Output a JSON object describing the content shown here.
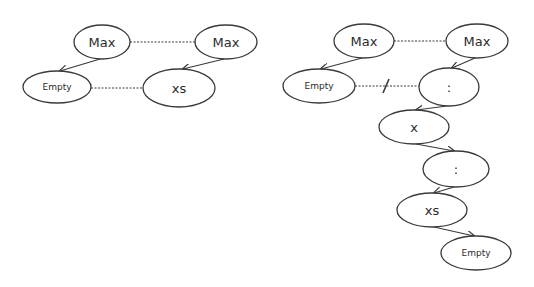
{
  "colors": {
    "stroke": "#3a3a3a",
    "text": "#2b2b2b",
    "background": "#ffffff"
  },
  "diagrams": [
    {
      "id": "before",
      "nodes": [
        {
          "id": "max_a",
          "label": "Max",
          "cx": 102,
          "cy": 42,
          "rx": 28,
          "ry": 17,
          "font": 13
        },
        {
          "id": "max_b",
          "label": "Max",
          "cx": 226,
          "cy": 42,
          "rx": 31,
          "ry": 17,
          "font": 13
        },
        {
          "id": "empty",
          "label": "Empty",
          "cx": 57,
          "cy": 87,
          "rx": 34,
          "ry": 16,
          "font": 9
        },
        {
          "id": "xs",
          "label": "xs",
          "cx": 179,
          "cy": 88,
          "rx": 36,
          "ry": 19,
          "font": 13
        }
      ],
      "arrows": [
        {
          "from": "max_a",
          "to": "empty",
          "x1": 100,
          "y1": 59,
          "x2": 60,
          "y2": 71
        },
        {
          "from": "max_b",
          "to": "xs",
          "x1": 224,
          "y1": 59,
          "x2": 183,
          "y2": 69
        }
      ],
      "dotted_links": [
        {
          "from": "max_a",
          "to": "max_b",
          "x1": 130,
          "y1": 42,
          "x2": 195,
          "y2": 42,
          "crossed": false
        },
        {
          "from": "empty",
          "to": "xs",
          "x1": 91,
          "y1": 88,
          "x2": 143,
          "y2": 88,
          "crossed": false
        }
      ]
    },
    {
      "id": "after",
      "nodes": [
        {
          "id": "max_a",
          "label": "Max",
          "cx": 364,
          "cy": 41,
          "rx": 30,
          "ry": 17,
          "font": 13
        },
        {
          "id": "max_b",
          "label": "Max",
          "cx": 477,
          "cy": 41,
          "rx": 31,
          "ry": 17,
          "font": 13
        },
        {
          "id": "empty_1",
          "label": "Empty",
          "cx": 319,
          "cy": 86,
          "rx": 36,
          "ry": 17,
          "font": 9
        },
        {
          "id": "cons_1",
          "label": ":",
          "cx": 449,
          "cy": 87,
          "rx": 30,
          "ry": 19,
          "font": 13
        },
        {
          "id": "x",
          "label": "x",
          "cx": 414,
          "cy": 127,
          "rx": 35,
          "ry": 17,
          "font": 13
        },
        {
          "id": "cons_2",
          "label": ":",
          "cx": 456,
          "cy": 169,
          "rx": 33,
          "ry": 18,
          "font": 13
        },
        {
          "id": "xs",
          "label": "xs",
          "cx": 432,
          "cy": 210,
          "rx": 35,
          "ry": 17,
          "font": 13
        },
        {
          "id": "empty_2",
          "label": "Empty",
          "cx": 476,
          "cy": 253,
          "rx": 35,
          "ry": 17,
          "font": 9
        }
      ],
      "arrows": [
        {
          "from": "max_a",
          "to": "empty_1",
          "x1": 362,
          "y1": 58,
          "x2": 321,
          "y2": 69
        },
        {
          "from": "max_b",
          "to": "cons_1",
          "x1": 475,
          "y1": 58,
          "x2": 452,
          "y2": 68
        },
        {
          "from": "cons_1",
          "to": "x",
          "x1": 447,
          "y1": 106,
          "x2": 416,
          "y2": 110
        },
        {
          "from": "x",
          "to": "cons_2",
          "x1": 416,
          "y1": 144,
          "x2": 454,
          "y2": 151
        },
        {
          "from": "cons_2",
          "to": "xs",
          "x1": 454,
          "y1": 187,
          "x2": 434,
          "y2": 193
        },
        {
          "from": "xs",
          "to": "empty_2",
          "x1": 434,
          "y1": 227,
          "x2": 474,
          "y2": 236
        }
      ],
      "dotted_links": [
        {
          "from": "max_a",
          "to": "max_b",
          "x1": 394,
          "y1": 41,
          "x2": 446,
          "y2": 41,
          "crossed": false
        },
        {
          "from": "empty_1",
          "to": "cons_1",
          "x1": 355,
          "y1": 86,
          "x2": 419,
          "y2": 86,
          "crossed": true,
          "cross_x": 386
        }
      ]
    }
  ]
}
